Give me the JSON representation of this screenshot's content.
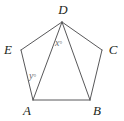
{
  "figure": {
    "type": "geometry-diagram",
    "shape": "regular-pentagon",
    "background_color": "#ffffff",
    "stroke_color": "#58585a",
    "label_color": "#231f20",
    "angle_label_color": "#6d6e71",
    "vertices": [
      {
        "name": "D",
        "label": "D",
        "x": 62,
        "y": 22,
        "label_x": 63,
        "label_y": 14
      },
      {
        "name": "E",
        "label": "E",
        "x": 21,
        "y": 50,
        "label_x": 8,
        "label_y": 54
      },
      {
        "name": "C",
        "label": "C",
        "x": 102,
        "y": 50,
        "label_x": 113,
        "label_y": 54
      },
      {
        "name": "A",
        "label": "A",
        "x": 33,
        "y": 100,
        "label_x": 27,
        "label_y": 115
      },
      {
        "name": "B",
        "label": "B",
        "x": 90,
        "y": 100,
        "label_x": 97,
        "label_y": 115
      }
    ],
    "edges": [
      {
        "name": "edge-DE",
        "from": "D",
        "to": "E"
      },
      {
        "name": "edge-EA",
        "from": "E",
        "to": "A"
      },
      {
        "name": "edge-AB",
        "from": "A",
        "to": "B"
      },
      {
        "name": "edge-BC",
        "from": "B",
        "to": "C"
      },
      {
        "name": "edge-CD",
        "from": "C",
        "to": "D"
      }
    ],
    "diagonals": [
      {
        "name": "diagonal-DA",
        "from": "D",
        "to": "A"
      },
      {
        "name": "diagonal-DB",
        "from": "D",
        "to": "B"
      }
    ],
    "angles": [
      {
        "name": "angle-x",
        "variable": "x",
        "degree_symbol": "°",
        "at_vertex": "D",
        "between": [
          "DA",
          "DB"
        ],
        "label_x": 55,
        "label_y": 46
      },
      {
        "name": "angle-y",
        "variable": "y",
        "degree_symbol": "°",
        "at_vertex": "A",
        "between": [
          "AE",
          "AD"
        ],
        "label_x": 29,
        "label_y": 79
      }
    ]
  }
}
